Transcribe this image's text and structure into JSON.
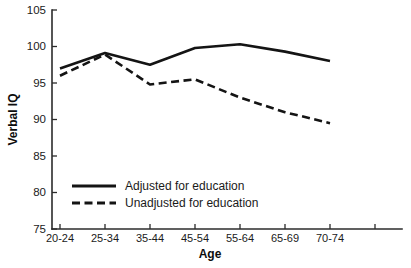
{
  "chart_data": {
    "type": "line",
    "title": "",
    "xlabel": "Age",
    "ylabel": "Verbal IQ",
    "categories": [
      "20-24",
      "25-34",
      "35-44",
      "45-54",
      "55-64",
      "65-69",
      "70-74"
    ],
    "ylim": [
      75,
      105
    ],
    "yticks": [
      75,
      80,
      85,
      90,
      95,
      100,
      105
    ],
    "ytick_labels": [
      "75",
      "80",
      "85",
      "90",
      "95",
      "100",
      "105"
    ],
    "grid": false,
    "legend_position": "inside-lower-left",
    "series": [
      {
        "name": "Adjusted for education",
        "style": "solid",
        "color": "#141414",
        "values": [
          97.0,
          99.1,
          97.5,
          99.8,
          100.3,
          99.3,
          98.0
        ]
      },
      {
        "name": "Unadjusted for education",
        "style": "dashed",
        "color": "#141414",
        "values": [
          96.0,
          98.9,
          94.8,
          95.5,
          93.0,
          91.0,
          89.5
        ]
      }
    ],
    "legend": [
      {
        "label": "Adjusted for education",
        "style": "solid"
      },
      {
        "label": "Unadjusted for education",
        "style": "dashed"
      }
    ]
  }
}
